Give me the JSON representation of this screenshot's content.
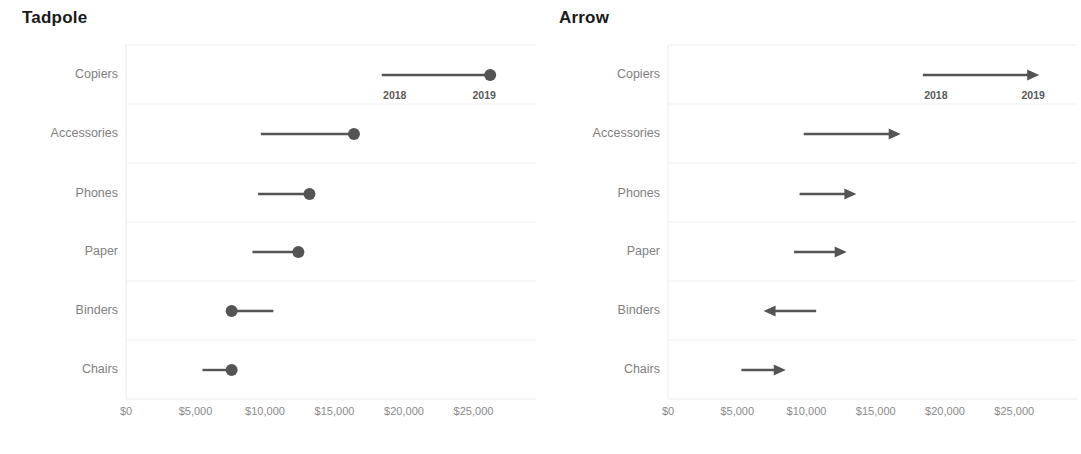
{
  "panels": [
    {
      "id": "tadpole",
      "title": "Tadpole",
      "mark": "dot"
    },
    {
      "id": "arrow",
      "title": "Arrow",
      "mark": "arrow"
    }
  ],
  "colors": {
    "mark": "#545454",
    "category_label": "#808080",
    "tick_label": "#8a8a8a",
    "year_label": "#5a5a5a",
    "gridline": "#f1f1f1",
    "axis_line": "#ececec",
    "title": "#1a1a1a",
    "background": "#ffffff"
  },
  "year_labels": {
    "start": "2018",
    "end": "2019"
  },
  "axis": {
    "tick_labels": [
      "$0",
      "$5,000",
      "$10,000",
      "$15,000",
      "$20,000",
      "$25,000"
    ],
    "tick_values": [
      0,
      5000,
      10000,
      15000,
      20000,
      25000
    ],
    "min": 0,
    "max": 27000
  },
  "chart_data": [
    {
      "type": "line",
      "title": "Tadpole",
      "xlabel": "",
      "ylabel": "",
      "xlim": [
        0,
        27000
      ],
      "grid": true,
      "legend": "none",
      "mark_style": "line-with-end-dot",
      "categories": [
        "Copiers",
        "Accessories",
        "Phones",
        "Paper",
        "Binders",
        "Chairs"
      ],
      "series": [
        {
          "name": "2018",
          "values": [
            18400,
            9700,
            9500,
            9100,
            10600,
            5500
          ]
        },
        {
          "name": "2019",
          "values": [
            26200,
            16400,
            13200,
            12400,
            7600,
            7600
          ]
        }
      ],
      "annotations": [
        {
          "text": "2018",
          "category": "Copiers",
          "value": 18400
        },
        {
          "text": "2019",
          "category": "Copiers",
          "value": 26200
        }
      ]
    },
    {
      "type": "line",
      "title": "Arrow",
      "xlabel": "",
      "ylabel": "",
      "xlim": [
        0,
        27000
      ],
      "grid": true,
      "legend": "none",
      "mark_style": "line-with-end-arrowhead",
      "categories": [
        "Copiers",
        "Accessories",
        "Phones",
        "Paper",
        "Binders",
        "Chairs"
      ],
      "series": [
        {
          "name": "2018",
          "values": [
            18400,
            9800,
            9500,
            9100,
            10700,
            5300
          ]
        },
        {
          "name": "2019",
          "values": [
            26800,
            16800,
            13600,
            12900,
            6900,
            8500
          ]
        }
      ],
      "annotations": [
        {
          "text": "2018",
          "category": "Copiers",
          "value": 18400
        },
        {
          "text": "2019",
          "category": "Copiers",
          "value": 26800
        }
      ]
    }
  ]
}
